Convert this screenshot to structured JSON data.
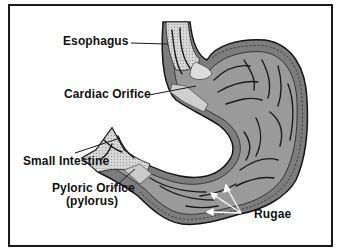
{
  "diagram": {
    "colors": {
      "frame": "#1a1a1a",
      "wall": "#7a7a7a",
      "mucosa": "#9a9a9a",
      "light_tissue": "#d4d4d4",
      "fold_lines": "#1c1c1c",
      "arrows": "#ffffff",
      "text": "#111111"
    },
    "labels": {
      "esophagus": "Esophagus",
      "cardiac_orifice": "Cardiac Orifice",
      "small_intestine": "Small Intestine",
      "pyloric_orifice_line1": "Pyloric Orifice",
      "pyloric_orifice_line2": "(pylorus)",
      "rugae": "Rugae"
    }
  }
}
